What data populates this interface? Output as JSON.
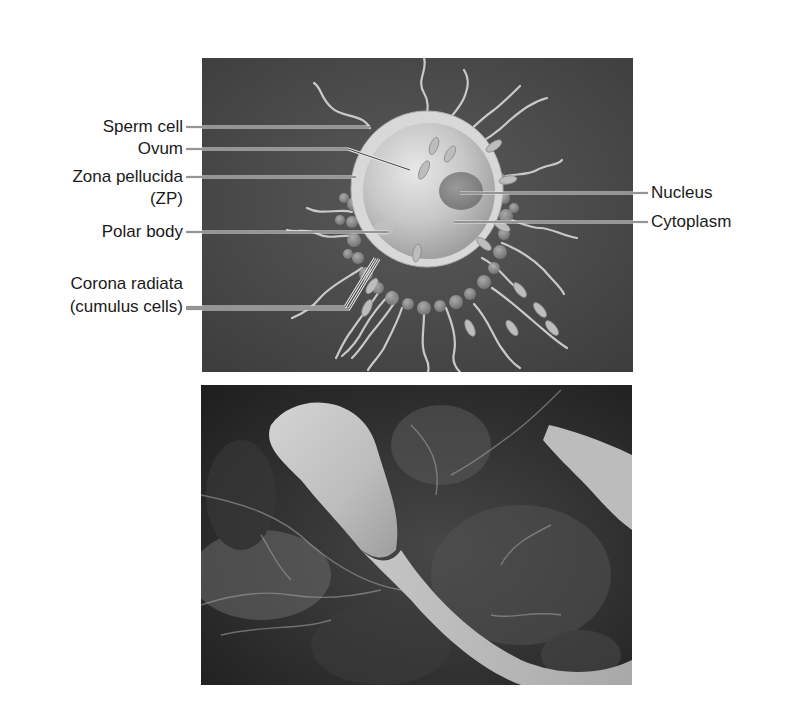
{
  "figure": {
    "top_panel": {
      "type": "illustration",
      "subject": "Ovum surrounded by sperm cells",
      "background_color": "#4a4a4a",
      "labels_left": [
        {
          "id": "sperm_cell",
          "text": "Sperm cell"
        },
        {
          "id": "ovum",
          "text": "Ovum"
        },
        {
          "id": "zona_pellucida",
          "text": "Zona pellucida",
          "text2": "(ZP)"
        },
        {
          "id": "polar_body",
          "text": "Polar body"
        },
        {
          "id": "corona_radiata",
          "text": "Corona radiata",
          "text2": "(cumulus cells)"
        }
      ],
      "labels_right": [
        {
          "id": "nucleus",
          "text": "Nucleus"
        },
        {
          "id": "cytoplasm",
          "text": "Cytoplasm"
        }
      ]
    },
    "bottom_panel": {
      "type": "scanning-electron-micrograph",
      "subject": "Sperm head contacting egg surface",
      "background_color": "#2e2e2e"
    }
  }
}
